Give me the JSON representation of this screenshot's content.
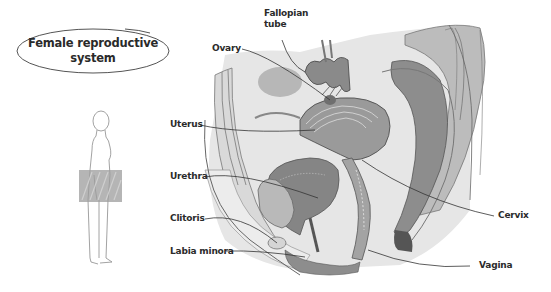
{
  "title": {
    "line1": "Female reproductive",
    "line2": "system"
  },
  "labels": {
    "fallopian_tube_line1": "Fallopian",
    "fallopian_tube_line2": "tube",
    "ovary": "Ovary",
    "uterus": "Uterus",
    "urethra": "Urethra",
    "clitoris": "Clitoris",
    "labia_minora": "Labia minora",
    "cervix": "Cervix",
    "vagina": "Vagina"
  },
  "colors": {
    "tissue_light": "#e4e4e4",
    "tissue_mid": "#bdbdbd",
    "tissue_dark": "#8a8a8a",
    "outline": "#555555",
    "text": "#2b2b2b"
  }
}
